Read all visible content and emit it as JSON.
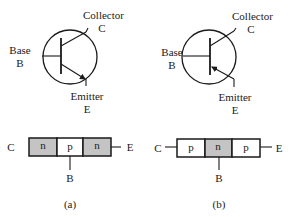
{
  "colors": {
    "stroke": "#1a1a1a",
    "n_fill": "#c4c4c4",
    "p_fill": "#ffffff",
    "background": "#ffffff"
  },
  "panels": [
    {
      "id": "a",
      "caption": "(a)",
      "type": "npn",
      "symbol": {
        "collector_label": "Collector",
        "collector_letter": "C",
        "base_label": "Base",
        "base_letter": "B",
        "emitter_label": "Emitter",
        "emitter_letter": "E",
        "arrow_direction": "outward"
      },
      "block": {
        "left_terminal": "C",
        "right_terminal": "E",
        "bottom_terminal": "B",
        "regions": [
          "n",
          "p",
          "n"
        ]
      }
    },
    {
      "id": "b",
      "caption": "(b)",
      "type": "pnp",
      "symbol": {
        "collector_label": "Collector",
        "collector_letter": "C",
        "base_label": "Base",
        "base_letter": "B",
        "emitter_label": "Emitter",
        "emitter_letter": "E",
        "arrow_direction": "inward"
      },
      "block": {
        "left_terminal": "C",
        "right_terminal": "E",
        "bottom_terminal": "B",
        "regions": [
          "p",
          "n",
          "p"
        ]
      }
    }
  ]
}
